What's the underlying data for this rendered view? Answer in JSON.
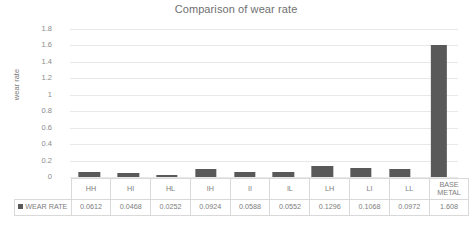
{
  "chart_data": {
    "type": "bar",
    "title": "Comparison of wear rate",
    "xlabel": "",
    "ylabel": "wear rate",
    "ylim": [
      0,
      1.8
    ],
    "grid": true,
    "legend_position": "data-table-row",
    "series_name": "WEAR RATE",
    "bar_color": "#595959",
    "gridline_color": "#e8e8e8",
    "categories": [
      "HH",
      "HI",
      "HL",
      "IH",
      "II",
      "IL",
      "LH",
      "LI",
      "LL",
      "BASE METAL"
    ],
    "values": [
      0.0612,
      0.0468,
      0.0252,
      0.0924,
      0.0588,
      0.0552,
      0.1296,
      0.1068,
      0.0972,
      1.608
    ],
    "y_ticks": [
      "1.8",
      "1.6",
      "1.4",
      "1.2",
      "1",
      "0.8",
      "0.6",
      "0.4",
      "0.2",
      "0"
    ],
    "y_tick_values": [
      1.8,
      1.6,
      1.4,
      1.2,
      1.0,
      0.8,
      0.6,
      0.4,
      0.2,
      0
    ],
    "value_labels": [
      "0.0612",
      "0.0468",
      "0.0252",
      "0.0924",
      "0.0588",
      "0.0552",
      "0.1296",
      "0.1068",
      "0.0972",
      "1.608"
    ],
    "category_lines": [
      [
        "HH"
      ],
      [
        "HI"
      ],
      [
        "HL"
      ],
      [
        "IH"
      ],
      [
        "II"
      ],
      [
        "IL"
      ],
      [
        "LH"
      ],
      [
        "LI"
      ],
      [
        "LL"
      ],
      [
        "BASE",
        "METAL"
      ]
    ]
  },
  "legend": {
    "marker_icon": "square-marker-icon",
    "label": "WEAR RATE"
  }
}
